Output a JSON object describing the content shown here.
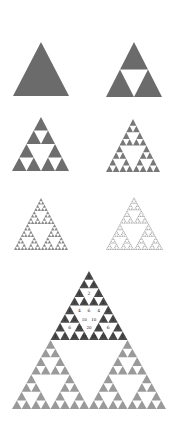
{
  "figure": {
    "colors": {
      "solid_fill": "#6b6b6b",
      "level2_fill": "#6e6e6e",
      "level3_fill": "#787878",
      "level4_fill": "#8a8a8a",
      "level5_fill": "#a8a8a8",
      "pascal_odd_dark": "#4a4a4a",
      "pascal_odd_light": "#9a9a9a",
      "background": "#ffffff"
    },
    "panels": [
      {
        "id": "iteration-0",
        "depth": 0,
        "apex": [
          41,
          42
        ],
        "base_y": 96,
        "base_left": 13,
        "base_right": 69,
        "color_key": "solid_fill"
      },
      {
        "id": "iteration-1",
        "depth": 1,
        "apex": [
          134,
          42
        ],
        "base_y": 97,
        "base_left": 106,
        "base_right": 162,
        "color_key": "solid_fill"
      },
      {
        "id": "iteration-2",
        "depth": 2,
        "apex": [
          41,
          117
        ],
        "base_y": 171,
        "base_left": 12,
        "base_right": 69,
        "color_key": "level2_fill"
      },
      {
        "id": "iteration-3",
        "depth": 3,
        "apex": [
          133,
          119
        ],
        "base_y": 172,
        "base_left": 106,
        "base_right": 160,
        "color_key": "level3_fill"
      },
      {
        "id": "iteration-4",
        "depth": 4,
        "apex": [
          41,
          198
        ],
        "base_y": 250,
        "base_left": 14,
        "base_right": 68,
        "color_key": "level4_fill"
      },
      {
        "id": "iteration-5",
        "depth": 5,
        "apex": [
          134,
          197
        ],
        "base_y": 250,
        "base_left": 106,
        "base_right": 163,
        "color_key": "level5_fill"
      }
    ],
    "pascal": {
      "apex": [
        89,
        271
      ],
      "base_y": 409,
      "base_left": 11,
      "base_right": 165,
      "rows": 16,
      "highlight_rows": 8,
      "even_labels": [
        {
          "row": 2,
          "col": 1,
          "text": "2"
        },
        {
          "row": 4,
          "col": 1,
          "text": "4"
        },
        {
          "row": 4,
          "col": 2,
          "text": "6"
        },
        {
          "row": 4,
          "col": 3,
          "text": "4"
        },
        {
          "row": 5,
          "col": 2,
          "text": "10"
        },
        {
          "row": 5,
          "col": 3,
          "text": "10"
        },
        {
          "row": 6,
          "col": 1,
          "text": "6"
        },
        {
          "row": 6,
          "col": 3,
          "text": "20"
        },
        {
          "row": 6,
          "col": 5,
          "text": "6"
        }
      ],
      "odd_labels": [
        {
          "row": 0,
          "col": 0,
          "text": "1"
        },
        {
          "row": 1,
          "col": 0,
          "text": "1"
        },
        {
          "row": 1,
          "col": 1,
          "text": "1"
        },
        {
          "row": 2,
          "col": 0,
          "text": "1"
        },
        {
          "row": 2,
          "col": 2,
          "text": "1"
        },
        {
          "row": 3,
          "col": 0,
          "text": "1"
        },
        {
          "row": 3,
          "col": 1,
          "text": "3"
        },
        {
          "row": 3,
          "col": 2,
          "text": "3"
        },
        {
          "row": 3,
          "col": 3,
          "text": "1"
        },
        {
          "row": 4,
          "col": 0,
          "text": "1"
        },
        {
          "row": 4,
          "col": 4,
          "text": "1"
        },
        {
          "row": 5,
          "col": 0,
          "text": "1"
        },
        {
          "row": 5,
          "col": 1,
          "text": "5"
        },
        {
          "row": 5,
          "col": 4,
          "text": "5"
        },
        {
          "row": 5,
          "col": 5,
          "text": "1"
        },
        {
          "row": 6,
          "col": 0,
          "text": "1"
        },
        {
          "row": 6,
          "col": 2,
          "text": "15"
        },
        {
          "row": 6,
          "col": 4,
          "text": "15"
        },
        {
          "row": 6,
          "col": 6,
          "text": "1"
        },
        {
          "row": 7,
          "col": 0,
          "text": "1"
        },
        {
          "row": 7,
          "col": 1,
          "text": "7"
        },
        {
          "row": 7,
          "col": 2,
          "text": "21"
        },
        {
          "row": 7,
          "col": 3,
          "text": "35"
        },
        {
          "row": 7,
          "col": 4,
          "text": "35"
        },
        {
          "row": 7,
          "col": 5,
          "text": "21"
        },
        {
          "row": 7,
          "col": 6,
          "text": "7"
        },
        {
          "row": 7,
          "col": 7,
          "text": "1"
        }
      ]
    }
  }
}
